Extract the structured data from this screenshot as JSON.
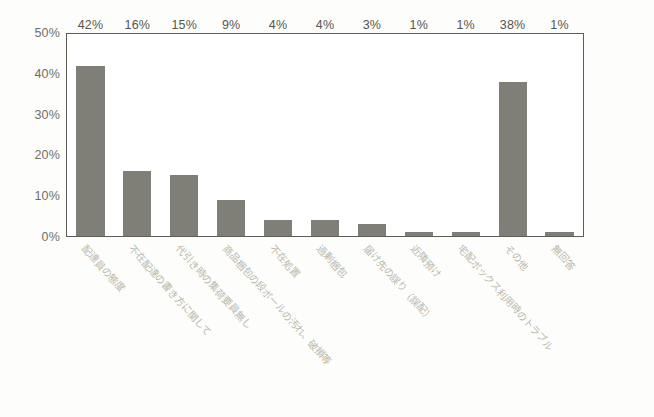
{
  "chart_data": {
    "type": "bar",
    "title": "",
    "subtitle": "",
    "xlabel": "",
    "ylabel": "",
    "ylim": [
      0,
      50
    ],
    "yticks": [
      "0%",
      "10%",
      "20%",
      "30%",
      "40%",
      "50%"
    ],
    "ytick_values": [
      0,
      10,
      20,
      30,
      40,
      50
    ],
    "grid": false,
    "legend": false,
    "bar_color": "#7f7f77",
    "plot_border_color": "#5d5d57",
    "label_color": "#6e6e66",
    "categories": [
      "配達員の態度",
      "不在配達の書き方に関して",
      "代引き時の集荷要員無し",
      "商品梱包の段ボールの汚れ、破損等",
      "不在処置",
      "過剰梱包",
      "届け先の誤り（誤配）",
      "近隣預け",
      "宅配ボックス利用時のトラブル",
      "その他",
      "無回答"
    ],
    "values": [
      42,
      16,
      15,
      9,
      4,
      4,
      3,
      1,
      1,
      38,
      1
    ],
    "value_labels": [
      "42%",
      "16%",
      "15%",
      "9%",
      "4%",
      "4%",
      "3%",
      "1%",
      "1%",
      "38%",
      "1%"
    ]
  }
}
